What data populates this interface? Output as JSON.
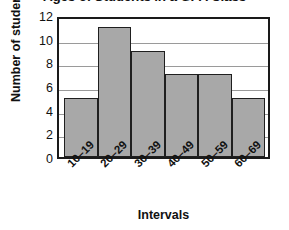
{
  "chart_data": {
    "type": "bar",
    "title": "Ages of Students in a GPA Class",
    "xlabel": "Intervals",
    "ylabel": "Number of students",
    "categories": [
      "10–19",
      "20–29",
      "30–39",
      "40–49",
      "50–59",
      "60–69"
    ],
    "values": [
      5,
      11,
      9,
      7,
      7,
      5
    ],
    "ylim": [
      0,
      12
    ],
    "yticks": [
      0,
      2,
      4,
      6,
      8,
      10,
      12
    ],
    "grid": true,
    "legend": false,
    "bar_color": "#a8a8a8",
    "bar_border_color": "#1f1f1f",
    "axis_color": "#1a1a1a",
    "gridline_color": "#9a9a9a"
  }
}
